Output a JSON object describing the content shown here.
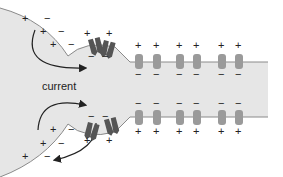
{
  "diagram": {
    "labels": {
      "current": "current"
    },
    "charges": {
      "plus": "+",
      "minus": "−"
    },
    "colors": {
      "axon_fill": "#e6e6e6",
      "membrane_line": "#8a8a8a",
      "open_channel": "#555555",
      "closed_channel": "#9a9a9a",
      "text": "#222222",
      "arrow": "#222222"
    },
    "regions": [
      {
        "name": "depolarized-region",
        "membrane_outside": "-",
        "membrane_inside": "+",
        "channels": "open"
      },
      {
        "name": "resting-region",
        "membrane_outside": "+",
        "membrane_inside": "-",
        "channels": "closed"
      }
    ],
    "open_channel_count_top": 2,
    "open_channel_count_bottom": 2,
    "closed_channel_count_top": 6,
    "closed_channel_count_bottom": 6
  }
}
